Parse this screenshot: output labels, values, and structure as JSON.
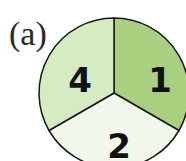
{
  "figure": {
    "part_label": "(a)",
    "spinner": {
      "sectors": [
        {
          "label": "1",
          "color": "#a9d07f",
          "position": "upper-right"
        },
        {
          "label": "2",
          "color": "#f2f9ec",
          "position": "bottom"
        },
        {
          "label": "4",
          "color": "#d5ebc2",
          "position": "upper-left"
        }
      ],
      "outline_color": "#1a1a1a"
    }
  }
}
